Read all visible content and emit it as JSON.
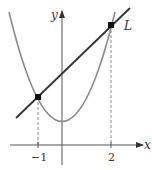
{
  "diagram": {
    "axes": {
      "x_label": "x",
      "y_label": "y"
    },
    "curves": [
      {
        "name": "parabola",
        "equation": "y = x^2 + 1",
        "color": "#8a8a8a"
      },
      {
        "name": "line",
        "label": "L",
        "equation": "y = x + 3",
        "color": "#333333"
      }
    ],
    "intersection_points": [
      {
        "x": -1,
        "y": 2
      },
      {
        "x": 2,
        "y": 5
      }
    ],
    "x_ticks": [
      {
        "value": -1,
        "label": "−1"
      },
      {
        "value": 2,
        "label": "2"
      }
    ],
    "line_label": "L",
    "colors": {
      "axis": "#555555",
      "parabola": "#8a8a8a",
      "line": "#333333",
      "dashed": "#888888",
      "point": "#111111"
    }
  }
}
